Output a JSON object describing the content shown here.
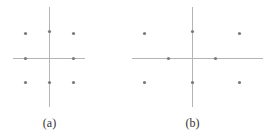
{
  "colors": {
    "axis": "#b4b4b4",
    "point": "#7a7a7a",
    "label": "#333333"
  },
  "panels": [
    {
      "label": "(a)",
      "axes": {
        "h": {
          "x1": 13,
          "x2": 85,
          "y": 58
        },
        "v": {
          "x": 49,
          "y1": 7,
          "y2": 107
        }
      },
      "label_pos": {
        "x": 49,
        "y": 127
      },
      "points": [
        {
          "x": 25,
          "y": 33
        },
        {
          "x": 49,
          "y": 31
        },
        {
          "x": 73,
          "y": 33
        },
        {
          "x": 25,
          "y": 58
        },
        {
          "x": 73,
          "y": 58
        },
        {
          "x": 25,
          "y": 82
        },
        {
          "x": 49,
          "y": 82
        },
        {
          "x": 73,
          "y": 82
        }
      ]
    },
    {
      "label": "(b)",
      "axes": {
        "h": {
          "x1": 132,
          "x2": 263,
          "y": 58
        },
        "v": {
          "x": 192,
          "y1": 7,
          "y2": 107
        }
      },
      "label_pos": {
        "x": 192,
        "y": 127
      },
      "points": [
        {
          "x": 144,
          "y": 33
        },
        {
          "x": 192,
          "y": 31
        },
        {
          "x": 239,
          "y": 33
        },
        {
          "x": 168,
          "y": 58
        },
        {
          "x": 215,
          "y": 58
        },
        {
          "x": 144,
          "y": 82
        },
        {
          "x": 192,
          "y": 82
        },
        {
          "x": 239,
          "y": 82
        }
      ]
    }
  ]
}
